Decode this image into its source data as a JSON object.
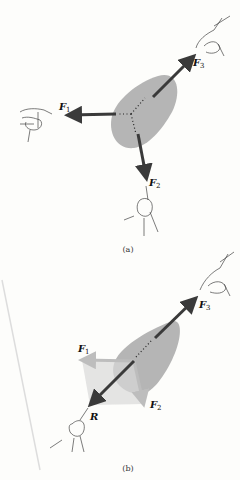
{
  "panel_a": {
    "caption": "(a)",
    "forces": [
      {
        "name": "F",
        "sub": "1"
      },
      {
        "name": "F",
        "sub": "2"
      },
      {
        "name": "F",
        "sub": "3"
      }
    ]
  },
  "panel_b": {
    "caption": "(b)",
    "forces": [
      {
        "name": "F",
        "sub": "1"
      },
      {
        "name": "F",
        "sub": "2"
      },
      {
        "name": "F",
        "sub": "3"
      }
    ],
    "resultant": "R"
  },
  "colors": {
    "body": "#b5b5b5",
    "arrow": "#3a3a3a",
    "component_fill": "#d9d9d9",
    "component_arrow": "#bdbdbd"
  }
}
